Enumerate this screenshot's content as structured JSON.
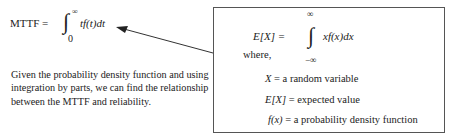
{
  "mttf_formula": {
    "lhs": "MTTF =",
    "integral": "∫",
    "upper": "∞",
    "lower": "0",
    "integrand": "tf(t)dt"
  },
  "paragraph": "Given the probability density function and using integration by parts, we can find the relationship between the MTTF and reliability.",
  "box": {
    "expectation": {
      "lhs": "E[X] =",
      "integral": "∫",
      "upper": "∞",
      "lower": "−∞",
      "integrand": "xf(x)dx"
    },
    "where_label": "where,",
    "definitions": [
      {
        "symbol": "X",
        "text": " = a random variable"
      },
      {
        "symbol": "E[X]",
        "text": " = expected value"
      },
      {
        "symbol": "f(x)",
        "text": " = a probability density function"
      }
    ]
  },
  "colors": {
    "text": "#222222",
    "border": "#555555",
    "arrow": "#333333"
  }
}
